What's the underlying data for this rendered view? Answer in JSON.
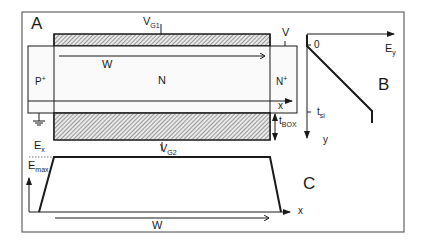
{
  "figure": {
    "panels": {
      "A": {
        "label": "A",
        "regions": {
          "source": "P",
          "source_sup": "+",
          "body": "N",
          "drain": "N",
          "drain_sup": "+"
        },
        "gate_top": {
          "label": "V",
          "sub": "G1"
        },
        "gate_bottom": {
          "label": "V",
          "sub": "G2"
        },
        "drain_bias": "V",
        "width_label": "W",
        "axis_x": "x",
        "axis_y": "y",
        "t_box": {
          "label": "t",
          "sub": "BOX"
        }
      },
      "B": {
        "label": "B",
        "axis_h": {
          "label": "E",
          "sub": "y"
        },
        "tick_zero": "0",
        "tick_tsi": {
          "label": "t",
          "sub": "si"
        },
        "axis_v": "y"
      },
      "C": {
        "label": "C",
        "axis_v": {
          "label": "E",
          "sub": "x"
        },
        "emax": {
          "label": "E",
          "sub": "max"
        },
        "axis_h": "x",
        "width_label": "W"
      }
    },
    "colors": {
      "line": "#1a1a1a",
      "hatch": "#555555",
      "frame": "#444444"
    }
  }
}
